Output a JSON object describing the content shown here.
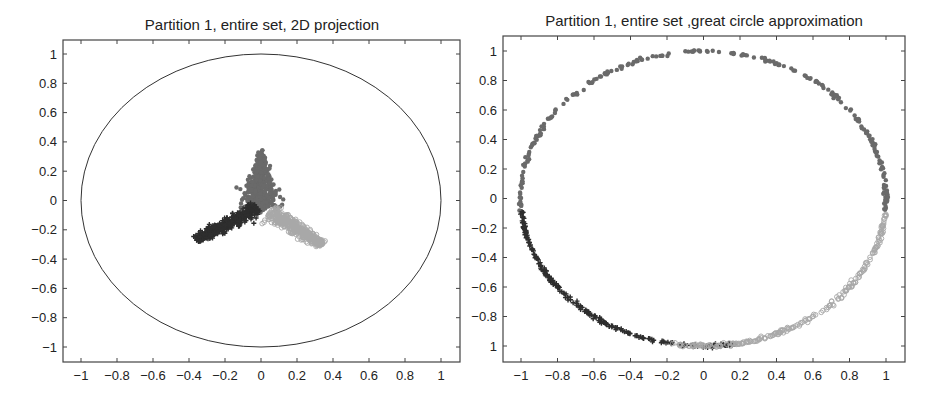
{
  "chart_data": [
    {
      "type": "scatter",
      "title": "Partition 1, entire set, 2D projection",
      "xlabel": "",
      "ylabel": "",
      "xlim": [
        -1.1,
        1.1
      ],
      "ylim": [
        -1.1,
        1.1
      ],
      "xticks": [
        "-1",
        "-0.8",
        "-0.6",
        "-0.4",
        "-0.2",
        "0",
        "0.2",
        "0.4",
        "0.6",
        "0.8",
        "1"
      ],
      "xtick_values": [
        -1,
        -0.8,
        -0.6,
        -0.4,
        -0.2,
        0,
        0.2,
        0.4,
        0.6,
        0.8,
        1
      ],
      "yticks": [
        "1",
        "0.8",
        "0.6",
        "0.4",
        "0.2",
        "0",
        "-0.2",
        "-0.4",
        "-0.6",
        "-0.8",
        "-1"
      ],
      "ytick_values": [
        1,
        0.8,
        0.6,
        0.4,
        0.2,
        0,
        -0.2,
        -0.4,
        -0.6,
        -0.8,
        -1
      ],
      "grid": false,
      "reference_circle": {
        "center": [
          0,
          0
        ],
        "radius": 1
      },
      "series": [
        {
          "name": "cluster-top",
          "marker": "filled-dot",
          "color": "#6a6a6a",
          "region": {
            "apex": [
              0.0,
              0.32
            ],
            "base_center": [
              0.0,
              -0.05
            ],
            "spread": 0.09
          }
        },
        {
          "name": "cluster-left",
          "marker": "plus",
          "color": "#2e2e2e",
          "region": {
            "from": [
              -0.02,
              -0.05
            ],
            "to": [
              -0.36,
              -0.27
            ],
            "spread": 0.06
          }
        },
        {
          "name": "cluster-right",
          "marker": "open-circle",
          "color": "#a8a8a8",
          "region": {
            "from": [
              0.05,
              -0.08
            ],
            "to": [
              0.34,
              -0.3
            ],
            "spread": 0.06
          }
        }
      ]
    },
    {
      "type": "scatter",
      "title": "Partition 1, entire set ,great circle approximation",
      "xlabel": "",
      "ylabel": "",
      "xlim": [
        -1.1,
        1.1
      ],
      "ylim": [
        -1.1,
        1.1
      ],
      "xticks": [
        "-1",
        "-0.8",
        "-0.6",
        "-0.4",
        "-0.2",
        "0",
        "0.2",
        "0.4",
        "0.6",
        "0.8",
        "1"
      ],
      "xtick_values": [
        -1,
        -0.8,
        -0.6,
        -0.4,
        -0.2,
        0,
        0.2,
        0.4,
        0.6,
        0.8,
        1
      ],
      "yticks": [
        "1",
        "0.8",
        "0.6",
        "0.4",
        "0.2",
        "0",
        "-0.2",
        "-0.4",
        "-0.6",
        "-0.8",
        "1"
      ],
      "ytick_values": [
        1,
        0.8,
        0.6,
        0.4,
        0.2,
        0,
        -0.2,
        -0.4,
        -0.6,
        -0.8,
        -1
      ],
      "grid": false,
      "series": [
        {
          "name": "cluster-top",
          "marker": "filled-dot",
          "color": "#6a6a6a",
          "angle_range_deg": [
            -5,
            185
          ]
        },
        {
          "name": "cluster-left",
          "marker": "plus",
          "color": "#2e2e2e",
          "angle_range_deg": [
            185,
            280
          ]
        },
        {
          "name": "cluster-right",
          "marker": "open-circle",
          "color": "#a8a8a8",
          "angle_range_deg": [
            260,
            355
          ]
        }
      ]
    }
  ]
}
